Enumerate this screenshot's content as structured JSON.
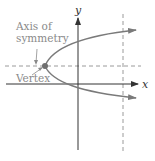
{
  "diagram": {
    "labels": {
      "axis_of_symmetry_line1": "Axis of",
      "axis_of_symmetry_line2": "symmetry",
      "vertex": "Vertex",
      "x_axis": "x",
      "y_axis": "y"
    },
    "colors": {
      "axes": "#333333",
      "curve": "#7a7a7a",
      "dashed": "#9a9a9a",
      "label": "#8a8a8a",
      "vertex_dot": "#6f6f6f"
    }
  }
}
